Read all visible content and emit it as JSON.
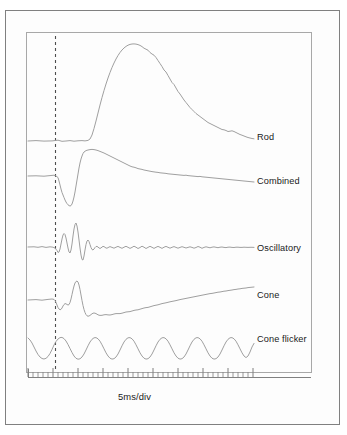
{
  "figure": {
    "kind": "erg-waveform-panel",
    "background_color": "#ffffff",
    "panel_fill": "#fdfdfd",
    "outer_border_color": "#808080",
    "plot_border_color": "#a8a8a8",
    "trace_color": "#9a9a9a",
    "axis_color": "#808080",
    "marker_color": "#4d4d4d",
    "text_color": "#1a1a1a"
  },
  "axis": {
    "caption": "5ms/div",
    "caption_x": 118,
    "caption_y": 397,
    "ruler_x_start": 28,
    "ruler_x_end": 253,
    "ruler_y": 377,
    "baseline_y_extension_end": 311,
    "minor_tick_count": 45,
    "minor_tick_height": 5,
    "major_tick_height": 9,
    "major_tick_every": 5
  },
  "stimulus_marker": {
    "name": "stimulus-onset-line",
    "x": 55,
    "y_top": 36,
    "y_bottom": 372,
    "dash": "3 3",
    "width": 1.1
  },
  "plot_box": {
    "x": 26,
    "y": 32,
    "width": 285,
    "height": 340
  },
  "traces": [
    {
      "id": "rod",
      "label": "Rod",
      "label_x": 257,
      "label_y": 138,
      "baseline_y": 141,
      "path": "M28,141 L36,140.6 L44,141.1 L52,140.9 L58,140.2 L62,141.3 L66,141 L70,140.6 L74,141.2 L78,140.8 L82,140.6 L85,140.9 L88,140.4 L90,139 L92,135 L94,128.5 L96,121 L98,113 L100,105 L102,97.5 L104,90.5 L106,84 L108,78 L110,72.5 L112,67.5 L114,63 L116,59 L118,55.5 L120,52.5 L122,50 L124,48 L126,46.4 L128,45.2 L130,44.4 L132,44 L134,43.9 L136,44.1 L138,44.6 L140,45.4 L142,46.6 L144,48.2 L146,49.2 L148,50.2 L150,52.5 L152,54 L154,55.2 L156,57.5 L158,60.5 L160,63.5 L162,66.5 L164,70 L166,72 L168,75.5 L170,79 L172,82.5 L174,84.5 L176,88 L178,91.5 L180,94 L182,97 L184,100 L186,102.5 L188,105 L190,107.5 L192,109.5 L194,111.5 L196,113.5 L198,115 L200,116.5 L202,118 L204,119.5 L206,121 L208,122.5 L210,123.5 L212,124.5 L214,125.5 L216,126.5 L218,127.5 L220,128.5 L222,129.5 L224,129.8 L226,130.5 L228,131.5 L230,131.2 L232,130.8 L234,131.5 L236,132.5 L238,133.5 L240,134.5 L242,135.2 L244,136 L246,136.8 L248,137.5 L250,138 L252,138.5 L254,138.8"
    },
    {
      "id": "combined",
      "label": "Combined",
      "label_x": 257,
      "label_y": 182,
      "baseline_y": 176,
      "path": "M28,176 L36,175.8 L44,176.2 L50,175.6 L54,175.2 L56,176 L58,177.5 L59,181 L60,185 L61,189 L62,192.5 L63,195 L64,197.5 L65,200 L66,202 L67,203.6 L68,204.8 L69,205.6 L70,206 L71,205.6 L72,204 L73,201 L74,197 L75,192 L76,186 L77,180 L78,174 L79,168 L80,163 L81,159 L82,156 L83,153.5 L84,152 L86,150.6 L88,150 L90,149.6 L92,149.4 L94,149.6 L96,150 L98,150.6 L100,151.4 L102,152.2 L104,153 L106,154 L108,155 L110,156 L112,157 L114,158 L116,159 L118,160 L120,161 L122,162 L124,163 L126,164 L128,165 L130,166 L132,166.8 L134,167.2 L136,167.8 L138,168.6 L140,169 L142,169.4 L144,170 L146,170.4 L148,170.8 L150,171.2 L152,171.6 L154,171.9 L156,172.2 L158,172.4 L160,172.8 L162,173 L164,173.2 L166,173.4 L168,173.8 L170,174 L172,174.2 L174,174.4 L176,174.6 L178,174.8 L180,175 L182,175.2 L184,175.4 L186,175.2 L188,175.6 L190,175.8 L192,176 L194,176.2 L196,176.4 L198,176.6 L200,176.4 L202,176.8 L204,177 L206,177.2 L208,177.4 L210,177.6 L212,177.8 L214,178 L216,178.2 L218,178.4 L220,178.6 L222,178.8 L224,179 L226,179.2 L228,179.4 L230,179.6 L232,179.8 L234,180 L236,180.2 L238,180.4 L240,180.6 L242,180.8 L244,181 L246,181.2 L248,181.4 L250,181.6 L252,181.8 L254,182"
    },
    {
      "id": "oscillatory",
      "label": "Oscillatory",
      "label_x": 257,
      "label_y": 249,
      "baseline_y": 247,
      "path": "M28,247 L34,246.8 L38,247.3 L42,246.6 L46,247.4 L50,246.8 L53,247.2 L55,248 L57,250.5 L58,252.5 L59,252 L60,249 L61,244 L62,239 L63,235 L64,233.5 L65,234.5 L66,238 L67,243 L68,248 L69,252 L70,253 L71,250 L72,244 L73,236 L74,229 L75,224.5 L76,223 L77,226 L78,232 L79,240 L80,248 L81,255 L82,259.5 L83,260 L84,256 L85,250 L86,244.5 L87,241 L88,240 L89,241.5 L90,244.5 L91,247.5 L92,249.5 L93,250 L94,249 L95,247.5 L96,246.5 L97,246.4 L98,247 L99,248 L100,248.4 L101,248 L102,247 L103,246.4 L104,246.6 L105,247.3 L106,248 L107,248.2 L108,247.6 L110,246.6 L112,247.4 L114,248.2 L116,247.2 L118,246.4 L120,247.4 L122,248.3 L124,247.2 L126,246.3 L128,247.3 L130,248.4 L132,247.4 L134,246.2 L136,247.2 L138,248.5 L140,247.5 L142,246.2 L144,247.2 L146,248.5 L148,247.4 L150,246.3 L152,247.3 L154,248.4 L156,247.3 L158,246.4 L160,247.3 L162,248.4 L164,247.2 L166,246.4 L168,247.3 L170,248.2 L172,247.3 L174,246.6 L176,247.4 L178,248.2 L180,247.4 L182,246.7 L184,247.3 L186,248 L188,247.4 L190,246.8 L192,247.4 L194,248.2 L196,247.5 L198,246.5 L200,247.2 L202,248.3 L204,247.4 L206,246.8 L208,247.3 L210,247.8 L212,247.2 L214,246.9 L216,247.3 L218,247.7 L220,247.2 L222,247 L224,247.4 L226,247.6 L228,247.2 L230,247.1 L232,247.4 L234,247.5 L236,247.2 L238,247.2 L240,247.4 L242,247.4 L244,247.2 L246,247.3 L248,247.4 L250,247.3 L252,247.3 L254,247.4"
    },
    {
      "id": "cone",
      "label": "Cone",
      "label_x": 257,
      "label_y": 296,
      "baseline_y": 300,
      "path": "M28,300 L36,299.6 L42,300.2 L48,299.4 L52,299 L54,299.4 L55,300.4 L56,302.5 L57,305 L58,307.5 L59,309 L60,309.8 L61,309.4 L62,308 L63,306 L64,304.5 L65,303.6 L66,303.8 L67,304.5 L68,305 L69,304.6 L70,302.5 L71,299 L72,294.5 L73,290 L74,286 L75,283 L76,281.5 L77,281 L78,282 L79,285 L80,289.5 L81,295 L82,300.5 L83,305.5 L84,309.5 L85,312.5 L86,314.6 L87,315.8 L88,316.2 L89,316 L90,315.4 L91,314.6 L92,313.8 L93,313.2 L94,313 L95,313.2 L96,313.6 L97,314.2 L98,314.8 L99,315.2 L100,315.4 L102,315.3 L104,314.8 L106,314.6 L108,314.9 L110,315 L112,314.6 L114,314 L116,313.6 L118,313.6 L120,313.6 L122,313.2 L124,312.6 L126,312 L128,311.8 L130,311.6 L132,311 L134,310.4 L136,310 L138,309.8 L140,309.2 L142,308.6 L144,308 L146,307.6 L148,307.4 L150,306.8 L152,306.2 L154,305.6 L156,305.2 L158,304.8 L160,304.2 L162,303.6 L164,303.2 L166,302.8 L168,302.3 L170,301.8 L172,301.4 L174,301 L176,300.6 L178,300.1 L180,299.6 L182,299.2 L184,298.8 L186,298.4 L188,298 L190,297.6 L192,297.2 L194,296.8 L196,296.4 L198,296 L200,295.6 L202,295.2 L204,294.8 L206,294.4 L208,294 L210,293.6 L212,293.4 L214,293 L216,292.6 L218,292.2 L220,292 L222,291.6 L224,291.2 L226,291 L228,290.6 L230,290.3 L232,290 L234,289.6 L236,289.4 L238,289 L240,288.8 L242,288.4 L244,288.2 L246,288 L248,287.6 L250,287.4 L252,287.2 L254,287"
    },
    {
      "id": "cone-flicker",
      "label": "Cone flicker",
      "label_x": 257,
      "label_y": 340,
      "baseline_y": 348,
      "cycles": 8,
      "path": "M28,338 L30,340 L32,343 L34,347 L36,351 L38,354.5 L40,357 L42,358.5 L44,359 L46,358.3 L48,356.5 L50,353.5 L52,349.5 L54,345 L56,341.5 L58,339 L60,337.6 L62,337.4 L64,338.6 L66,341 L68,344.5 L70,348.5 L72,352.5 L74,356 L76,358.3 L78,359.2 L80,358.8 L82,357 L84,354 L86,350 L88,345.8 L90,342 L92,339.3 L94,337.8 L96,337.6 L98,338.8 L100,341.2 L102,344.8 L104,348.8 L106,352.8 L108,356 L110,358.2 L112,359.1 L114,358.7 L116,357 L118,354 L120,350 L122,345.8 L124,342 L126,339.3 L128,337.8 L130,337.6 L132,338.8 L134,341.2 L136,344.8 L138,348.8 L140,352.8 L142,356 L144,358.2 L146,359.1 L148,358.7 L150,357 L152,354 L154,350 L156,345.8 L158,342 L160,339.3 L162,337.8 L164,337.6 L166,338.8 L168,341.2 L170,344.8 L172,348.8 L174,352.8 L176,356 L178,358.2 L180,359.1 L182,358.7 L184,357 L186,354 L188,350 L190,345.8 L192,342 L194,339.3 L196,337.8 L198,337.6 L200,338.8 L202,341.2 L204,344.8 L206,348.8 L208,352.8 L210,356 L212,358.2 L214,359.1 L216,358.7 L218,357 L220,354 L222,350 L224,345.8 L226,342 L228,339.3 L230,337.8 L232,337.6 L234,338.8 L236,341.2 L238,344.8 L240,348.8 L242,352.8 L244,356 L246,357.6 L248,356 L250,352 L252,347 L254,343.4"
    }
  ]
}
